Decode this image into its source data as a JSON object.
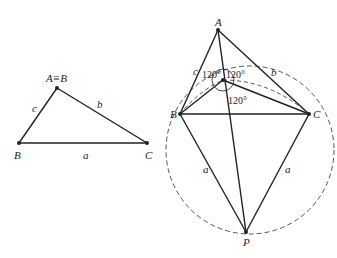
{
  "left_figure": {
    "vertices": {
      "B": "B",
      "A": "A≡B",
      "C": "C"
    },
    "sides": {
      "a": "a",
      "b": "b",
      "c": "c"
    }
  },
  "right_figure": {
    "vertices": {
      "A": "A",
      "B": "B",
      "C": "C",
      "P": "P"
    },
    "sides": {
      "b": "b",
      "c": "c",
      "a_left": "a",
      "a_right": "a"
    },
    "angles": [
      "120°",
      "120°",
      "120°"
    ]
  },
  "colors": {
    "stroke": "#222222",
    "background": "#ffffff"
  }
}
